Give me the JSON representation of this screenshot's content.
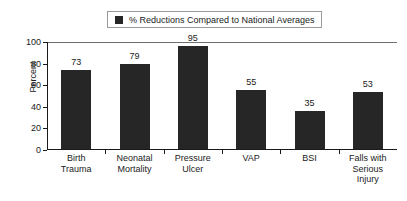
{
  "legend": {
    "swatch_name": "series-color-swatch",
    "swatch_color": "#262626",
    "label": "% Reductions Compared to National Averages"
  },
  "axis": {
    "ylabel": "Percent",
    "yticks": [
      "0",
      "20",
      "40",
      "60",
      "80",
      "100"
    ]
  },
  "chart_data": {
    "type": "bar",
    "title": "",
    "subtitle": "",
    "xlabel": "",
    "ylabel": "Percent",
    "ylim": [
      0,
      100
    ],
    "ytick_values": [
      0,
      20,
      40,
      60,
      80,
      100
    ],
    "grid": false,
    "legend_position": "top-center",
    "legend_entries": [
      "% Reductions Compared to National Averages"
    ],
    "bar_color": "#262626",
    "categories": [
      "Birth\nTrauma",
      "Neonatal\nMortality",
      "Pressure\nUlcer",
      "VAP",
      "BSI",
      "Falls with\nSerious\nInjury"
    ],
    "category_labels_flat": [
      "Birth Trauma",
      "Neonatal Mortality",
      "Pressure Ulcer",
      "VAP",
      "BSI",
      "Falls with Serious Injury"
    ],
    "values": [
      73,
      79,
      95,
      55,
      35,
      53
    ],
    "value_labels": [
      "73",
      "79",
      "95",
      "55",
      "35",
      "53"
    ],
    "series": [
      {
        "name": "% Reductions Compared to National Averages",
        "values": [
          73,
          79,
          95,
          55,
          35,
          53
        ]
      }
    ]
  }
}
